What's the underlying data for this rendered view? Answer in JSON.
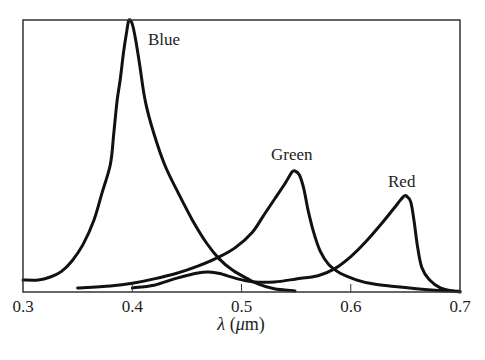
{
  "chart_data": {
    "type": "line",
    "title": "",
    "xlabel": "λ (μm)",
    "xlabel_symbol": "λ",
    "xlabel_unit_open": " (",
    "xlabel_unit_mu": "μ",
    "xlabel_unit_rest": "m)",
    "ylabel": "",
    "xlim": [
      0.3,
      0.7
    ],
    "ylim": [
      0,
      1
    ],
    "grid": false,
    "legend": "inline labels",
    "x_ticks": [
      0.3,
      0.4,
      0.5,
      0.6,
      0.7
    ],
    "x_tick_labels": [
      "0.3",
      "0.4",
      "0.5",
      "0.6",
      "0.7"
    ],
    "y_ticks": [],
    "series": [
      {
        "name": "Blue",
        "label": "Blue",
        "peak": {
          "x": 0.397,
          "y": 1.0
        },
        "points": [
          [
            0.3,
            0.044
          ],
          [
            0.314,
            0.044
          ],
          [
            0.325,
            0.055
          ],
          [
            0.335,
            0.075
          ],
          [
            0.345,
            0.115
          ],
          [
            0.355,
            0.175
          ],
          [
            0.365,
            0.265
          ],
          [
            0.372,
            0.36
          ],
          [
            0.38,
            0.47
          ],
          [
            0.383,
            0.58
          ],
          [
            0.386,
            0.7
          ],
          [
            0.389,
            0.78
          ],
          [
            0.392,
            0.88
          ],
          [
            0.395,
            0.96
          ],
          [
            0.397,
            1.0
          ],
          [
            0.4,
            0.985
          ],
          [
            0.403,
            0.93
          ],
          [
            0.407,
            0.83
          ],
          [
            0.412,
            0.7
          ],
          [
            0.42,
            0.58
          ],
          [
            0.43,
            0.465
          ],
          [
            0.442,
            0.365
          ],
          [
            0.455,
            0.265
          ],
          [
            0.468,
            0.18
          ],
          [
            0.48,
            0.12
          ],
          [
            0.492,
            0.08
          ],
          [
            0.505,
            0.05
          ],
          [
            0.515,
            0.03
          ],
          [
            0.53,
            0.012
          ],
          [
            0.549,
            0.004
          ]
        ]
      },
      {
        "name": "Green",
        "label": "Green",
        "peak": {
          "x": 0.549,
          "y": 0.445
        },
        "points": [
          [
            0.35,
            0.015
          ],
          [
            0.38,
            0.022
          ],
          [
            0.4,
            0.032
          ],
          [
            0.42,
            0.048
          ],
          [
            0.44,
            0.068
          ],
          [
            0.46,
            0.095
          ],
          [
            0.48,
            0.13
          ],
          [
            0.495,
            0.165
          ],
          [
            0.51,
            0.22
          ],
          [
            0.52,
            0.28
          ],
          [
            0.53,
            0.34
          ],
          [
            0.54,
            0.4
          ],
          [
            0.546,
            0.44
          ],
          [
            0.549,
            0.445
          ],
          [
            0.553,
            0.43
          ],
          [
            0.557,
            0.38
          ],
          [
            0.561,
            0.3
          ],
          [
            0.566,
            0.22
          ],
          [
            0.572,
            0.15
          ],
          [
            0.58,
            0.1
          ],
          [
            0.59,
            0.07
          ],
          [
            0.605,
            0.045
          ],
          [
            0.62,
            0.03
          ],
          [
            0.64,
            0.02
          ],
          [
            0.66,
            0.012
          ],
          [
            0.68,
            0.006
          ],
          [
            0.7,
            0.003
          ]
        ]
      },
      {
        "name": "Red",
        "label": "Red",
        "peak": {
          "x": 0.651,
          "y": 0.353
        },
        "points": [
          [
            0.4,
            0.015
          ],
          [
            0.42,
            0.025
          ],
          [
            0.44,
            0.05
          ],
          [
            0.46,
            0.07
          ],
          [
            0.47,
            0.074
          ],
          [
            0.48,
            0.068
          ],
          [
            0.495,
            0.05
          ],
          [
            0.51,
            0.038
          ],
          [
            0.53,
            0.037
          ],
          [
            0.55,
            0.048
          ],
          [
            0.57,
            0.06
          ],
          [
            0.585,
            0.085
          ],
          [
            0.6,
            0.13
          ],
          [
            0.615,
            0.19
          ],
          [
            0.63,
            0.26
          ],
          [
            0.642,
            0.32
          ],
          [
            0.648,
            0.35
          ],
          [
            0.651,
            0.353
          ],
          [
            0.655,
            0.33
          ],
          [
            0.658,
            0.26
          ],
          [
            0.661,
            0.17
          ],
          [
            0.665,
            0.09
          ],
          [
            0.672,
            0.045
          ],
          [
            0.682,
            0.015
          ],
          [
            0.693,
            0.004
          ],
          [
            0.7,
            0.0
          ]
        ]
      }
    ],
    "annotations": [
      {
        "text": "Blue",
        "x": 0.412,
        "y": 0.92
      },
      {
        "text": "Green",
        "x": 0.526,
        "y": 0.5
      },
      {
        "text": "Red",
        "x": 0.632,
        "y": 0.4
      }
    ]
  },
  "style": {
    "line_color": "#111111",
    "axis_color": "#333333",
    "background": "#ffffff"
  }
}
